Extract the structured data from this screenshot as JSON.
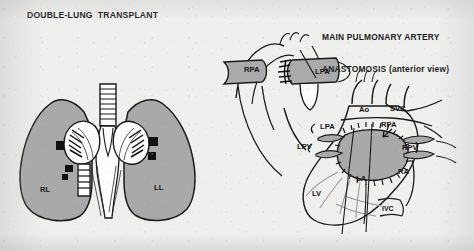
{
  "document": {
    "kind": "medical-illustration",
    "background_color": "#efefee",
    "ink_color": "#141414",
    "tissue_fill_color": "#a8a8a8",
    "vessel_fill_color": "#b0b0b0"
  },
  "panels": [
    {
      "id": "double-lung-transplant",
      "title": "DOUBLE-LUNG  TRANSPLANT",
      "labels": [
        {
          "key": "RL",
          "text": "RL",
          "meaning": "right lung",
          "x": 40,
          "y": 186
        },
        {
          "key": "LL",
          "text": "LL",
          "meaning": "left lung",
          "x": 154,
          "y": 184
        }
      ]
    },
    {
      "id": "main-pulmonary-artery-anastomosis",
      "title_line1": "MAIN PULMONARY ARTERY",
      "title_line2": "ANASTOMOSIS (anterior view)",
      "labels": [
        {
          "key": "RPA_top",
          "text": "RPA",
          "meaning": "right pulmonary artery",
          "x": 244,
          "y": 70
        },
        {
          "key": "LPA_top",
          "text": "LPA",
          "meaning": "left pulmonary artery",
          "x": 315,
          "y": 72
        },
        {
          "key": "Ao",
          "text": "Ao",
          "meaning": "aorta",
          "x": 361,
          "y": 108
        },
        {
          "key": "SVC",
          "text": "SVC",
          "meaning": "superior vena cava",
          "x": 392,
          "y": 107
        },
        {
          "key": "LPA_heart",
          "text": "LPA",
          "meaning": "left pulmonary artery",
          "x": 321,
          "y": 128
        },
        {
          "key": "RPA_heart",
          "text": "RPA",
          "meaning": "right pulmonary artery",
          "x": 382,
          "y": 126
        },
        {
          "key": "LPV",
          "text": "LPV",
          "meaning": "left pulmonary veins",
          "x": 300,
          "y": 146
        },
        {
          "key": "RPV",
          "text": "RPV",
          "meaning": "right pulmonary veins",
          "x": 403,
          "y": 147
        },
        {
          "key": "LA",
          "text": "LA",
          "meaning": "left atrium",
          "x": 357,
          "y": 177
        },
        {
          "key": "RA",
          "text": "RA",
          "meaning": "right atrium",
          "x": 398,
          "y": 171
        },
        {
          "key": "LV",
          "text": "LV",
          "meaning": "left ventricle",
          "x": 313,
          "y": 192
        },
        {
          "key": "IVC",
          "text": "IVC",
          "meaning": "inferior vena cava",
          "x": 383,
          "y": 207
        }
      ]
    }
  ]
}
